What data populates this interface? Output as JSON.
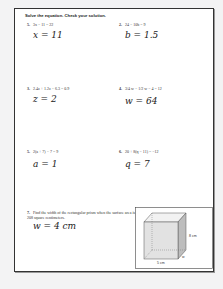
{
  "worksheet": {
    "instructions": "Solve the equation. Check your solution.",
    "problems": [
      {
        "number": "5.",
        "equation": "3x − 11 = 22",
        "answer": "x = 11"
      },
      {
        "number": "2.",
        "equation": "24 − 10b = 9",
        "answer": "b = 1.5"
      },
      {
        "number": "3.",
        "equation": "2.4z + 1.2z − 6.3 = 0.9",
        "answer": "z = 2"
      },
      {
        "number": "4.",
        "equation": "3/4 w − 1/2 w − 4 = 12",
        "answer": "w = 64"
      },
      {
        "number": "5.",
        "equation": "2(a + 7) − 7 = 9",
        "answer": "a = 1"
      },
      {
        "number": "6.",
        "equation": "20 + 8(q − 11) = −12",
        "answer": "q = 7"
      },
      {
        "number": "7.",
        "equation": "Find the width of the rectangular prism when the surface area is 208 square centimeters.",
        "answer": "w = 4 cm"
      }
    ],
    "figure": {
      "height_label": "8 cm",
      "length_label": "5 cm",
      "width_label": "w"
    }
  }
}
